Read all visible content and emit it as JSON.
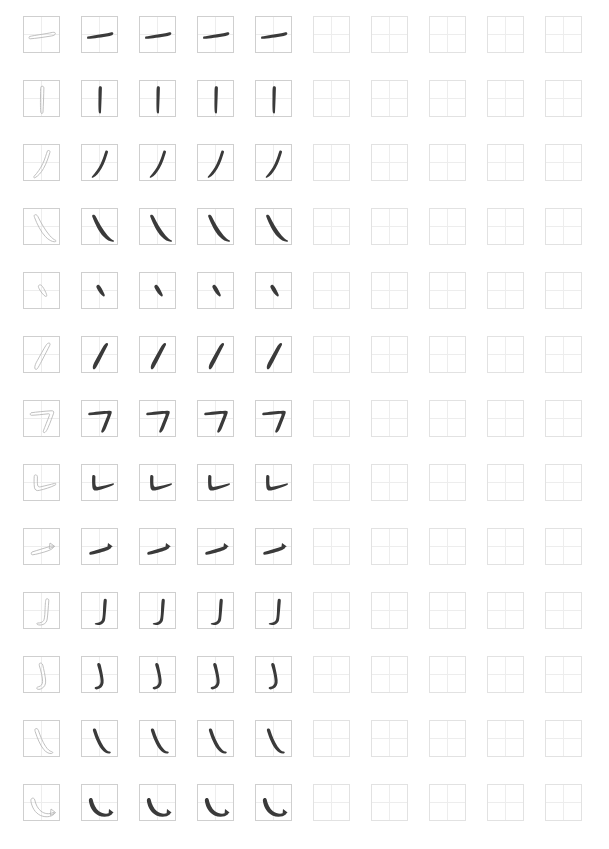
{
  "sheet": {
    "title": "Chinese Character Stroke Practice Sheet",
    "watermark": "",
    "background_color": "#ffffff",
    "cell_border_color": "#cfcfcf",
    "cell_guide_color": "#ededed",
    "outline_stroke_color": "#b9b9b9",
    "filled_stroke_color": "#3a3a3a",
    "columns": 10,
    "rows": 13,
    "cell_size_px": 37,
    "column_pitch_px": 58,
    "row_pitch_px": 64,
    "origin_x_px": 23,
    "origin_y_px": 16,
    "column_modes": [
      "outline",
      "filled",
      "filled",
      "filled",
      "filled",
      "empty",
      "empty",
      "empty",
      "empty",
      "empty"
    ]
  },
  "strokes": [
    {
      "index": 1,
      "name": "heng",
      "label": "横",
      "english": "horizontal",
      "path": "M 5.5 19.5 C 11 18.2, 20 17.2, 28.5 15.4 C 30.6 15.0, 31.6 15.6, 31.3 16.8 C 31.0 18.0, 29.6 18.6, 27.8 18.9 C 20.0 20.2, 11.5 21.4, 6.2 21.8 C 5.0 21.9, 4.6 20.9, 5.5 19.5 Z"
    },
    {
      "index": 2,
      "name": "shu",
      "label": "竖",
      "english": "vertical",
      "path": "M 17.2 5.5 C 18.6 4.8, 20.0 5.4, 19.9 7.0 C 19.7 14.0, 19.4 24.0, 19.0 31.0 C 18.9 32.6, 17.6 33.2, 17.0 31.8 C 16.4 30.4, 16.4 24.0, 16.5 16.0 C 16.6 10.5, 16.4 6.4, 17.2 5.5 Z"
    },
    {
      "index": 3,
      "name": "pie",
      "label": "撇",
      "english": "left-falling",
      "path": "M 23.5 5.8 C 25.0 5.0, 26.4 5.8, 25.9 7.4 C 24.6 11.8, 22.6 18.0, 19.5 23.5 C 17.0 28.0, 14.0 31.0, 11.2 32.6 C 10.0 33.3, 9.2 32.3, 10.2 31.2 C 13.2 28.0, 16.4 23.6, 18.8 18.6 C 21.0 14.0, 22.2 9.0, 23.5 5.8 Z"
    },
    {
      "index": 4,
      "name": "na",
      "label": "捺",
      "english": "right-falling",
      "path": "M 10.5 6.0 C 11.6 5.2, 13.0 5.8, 13.8 7.4 C 16.8 13.4, 21.0 21.0, 25.6 26.4 C 28.0 29.2, 30.0 30.6, 31.4 31.2 C 32.4 31.6, 32.2 32.8, 30.8 32.8 C 28.0 32.8, 24.6 31.0, 21.4 27.6 C 17.0 23.0, 13.0 15.0, 10.6 8.6 C 10.1 7.2, 10.0 6.4, 10.5 6.0 Z"
    },
    {
      "index": 5,
      "name": "dian",
      "label": "点",
      "english": "dot",
      "path": "M 14.8 12.4 C 15.8 11.4, 17.2 11.8, 18.4 13.4 C 20.2 15.9, 21.8 19.2, 22.6 21.6 C 23.1 23.1, 22.4 23.9, 21.2 23.2 C 19.2 22.0, 16.6 18.6, 15.0 15.4 C 14.2 13.9, 14.2 13.0, 14.8 12.4 Z"
    },
    {
      "index": 6,
      "name": "pie-dian",
      "label": "撇点",
      "english": "thick left-falling",
      "path": "M 24.2 6.2 C 25.6 5.6, 26.6 6.6, 25.8 8.2 C 23.6 12.6, 20.4 18.8, 17.6 24.2 C 15.8 27.6, 14.6 30.0, 13.4 31.6 C 12.4 32.9, 11.0 32.6, 10.8 31.0 C 10.6 29.0, 11.6 26.6, 13.2 23.8 C 16.0 18.8, 19.4 12.4, 21.8 8.6 C 22.8 7.0, 23.5 6.5, 24.2 6.2 Z"
    },
    {
      "index": 7,
      "name": "heng-zhe",
      "label": "横折",
      "english": "horizontal-turn",
      "path": "M 7.0 11.8 C 12.0 11.0, 21.0 10.2, 27.0 9.8 C 29.2 9.6, 30.2 10.4, 29.6 12.2 C 28.4 15.8, 26.4 21.2, 24.2 26.4 C 23.2 28.8, 22.2 30.4, 21.2 31.2 C 20.0 32.2, 18.8 31.4, 19.4 29.8 C 20.6 26.4, 23.4 19.6, 25.4 14.4 C 25.9 13.1, 25.6 12.6, 24.2 12.8 C 18.8 13.4, 11.6 14.2, 7.4 14.3 C 6.0 14.3, 5.8 12.4, 7.0 11.8 Z"
    },
    {
      "index": 8,
      "name": "shu-ti",
      "label": "竖提",
      "english": "vertical-rise",
      "path": "M 10.6 10.2 C 12.0 9.4, 13.4 10.2, 13.4 11.8 C 13.4 14.6, 13.2 18.0, 13.6 20.0 C 13.9 21.6, 14.8 22.2, 16.6 21.8 C 21.0 20.8, 27.0 19.4, 30.6 18.4 C 32.0 18.0, 32.6 19.2, 31.2 20.0 C 27.6 22.0, 20.0 24.4, 15.2 25.4 C 12.4 26.0, 10.8 25.0, 10.4 22.2 C 10.0 19.2, 10.0 14.0, 10.2 11.6 C 10.3 10.8, 10.4 10.3, 10.6 10.2 Z"
    },
    {
      "index": 9,
      "name": "ti",
      "label": "提",
      "english": "rising",
      "path": "M 8.0 23.0 C 13.0 21.4, 21.0 19.0, 26.6 17.2 C 28.6 16.6, 29.8 17.0, 29.4 18.2 C 29.0 19.4, 27.2 20.6, 24.0 21.8 C 19.0 23.6, 12.2 25.4, 8.6 25.8 C 7.0 26.0, 6.8 23.8, 8.0 23.0 Z M 26.0 14.0 L 30.8 17.4 L 25.2 19.6 Z"
    },
    {
      "index": 10,
      "name": "shu-gou",
      "label": "竖钩",
      "english": "vertical-hook",
      "path": "M 22.4 6.0 C 23.8 5.4, 25.0 6.2, 24.8 7.8 C 24.4 13.2, 23.8 21.6, 23.2 26.0 C 22.8 28.8, 21.6 30.4, 19.2 31.4 C 17.2 32.2, 15.0 32.2, 13.6 31.6 C 12.4 31.1, 12.6 30.0, 14.0 30.0 C 16.4 30.0, 18.6 29.2, 19.6 27.6 C 20.4 26.3, 20.8 23.0, 21.0 18.0 C 21.2 13.0, 21.4 8.2, 21.8 6.8 C 21.9 6.3, 22.1 6.1, 22.4 6.0 Z"
    },
    {
      "index": 11,
      "name": "wan-gou",
      "label": "弯钩",
      "english": "curved hook",
      "path": "M 15.6 6.4 C 17.0 5.6, 18.4 6.4, 18.8 8.2 C 19.8 12.4, 21.2 18.6, 21.6 23.0 C 22.0 27.2, 20.6 30.0, 17.6 31.6 C 15.6 32.6, 13.8 32.6, 13.0 31.8 C 12.2 31.0, 12.8 30.2, 14.4 29.8 C 17.0 29.2, 18.6 27.4, 18.6 24.4 C 18.6 20.6, 17.0 14.0, 15.4 8.8 C 15.1 7.6, 15.2 6.7, 15.6 6.4 Z"
    },
    {
      "index": 12,
      "name": "xie-gou",
      "label": "斜钩",
      "english": "slanted hook",
      "path": "M 11.2 8.0 C 12.4 7.0, 13.8 7.6, 14.4 9.4 C 16.0 14.2, 18.6 21.0, 21.6 25.4 C 23.8 28.6, 25.8 30.2, 27.6 30.6 C 29.0 30.9, 29.2 32.0, 27.8 32.4 C 25.4 33.0, 22.4 31.6, 19.8 28.6 C 16.2 24.4, 13.0 16.4, 11.2 10.6 C 10.8 9.2, 10.8 8.3, 11.2 8.0 Z"
    },
    {
      "index": 13,
      "name": "wo-gou",
      "label": "卧钩",
      "english": "reclining hook",
      "path": "M 7.6 13.6 C 8.8 12.6, 10.4 13.2, 10.8 15.0 C 11.6 19.0, 13.6 23.6, 17.0 26.2 C 20.6 29.0, 25.0 29.4, 29.0 27.6 C 30.4 27.0, 31.2 28.0, 30.0 29.2 C 27.0 32.0, 21.2 32.6, 16.4 30.4 C 11.2 28.0, 8.0 22.4, 7.0 16.8 C 6.7 15.0, 7.0 14.1, 7.6 13.6 Z M 27.0 24.0 L 31.6 27.6 L 26.4 30.4 Z"
    }
  ]
}
